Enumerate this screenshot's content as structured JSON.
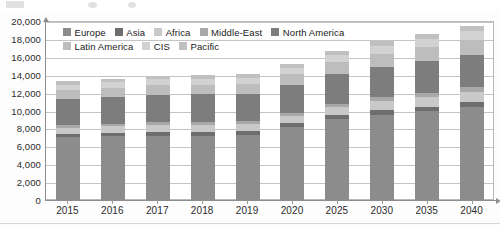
{
  "chart_data": {
    "type": "bar",
    "subtype": "stacked-bar",
    "title": "",
    "xlabel": "",
    "ylabel": "",
    "ylim": [
      0,
      20000
    ],
    "ytick_step": 2000,
    "ytick_labels": [
      "0",
      "2,000",
      "4,000",
      "6,000",
      "8,000",
      "10,000",
      "12,000",
      "14,000",
      "16,000",
      "18,000",
      "20,000"
    ],
    "grid": true,
    "legend_position": "top-inside",
    "categories": [
      "2015",
      "2016",
      "2017",
      "2018",
      "2019",
      "2020",
      "2025",
      "2030",
      "2035",
      "2040"
    ],
    "series": [
      {
        "name": "Europe",
        "color": "#8c8c8c",
        "values": [
          7000,
          7100,
          7200,
          7200,
          7250,
          8150,
          9000,
          9550,
          9900,
          10400
        ]
      },
      {
        "name": "Asia",
        "color": "#6e6e6e",
        "values": [
          400,
          410,
          420,
          430,
          440,
          450,
          480,
          510,
          540,
          570
        ]
      },
      {
        "name": "Africa",
        "color": "#c9c9c9",
        "values": [
          700,
          720,
          760,
          780,
          800,
          830,
          920,
          1000,
          1080,
          1150
        ]
      },
      {
        "name": "Middle-East",
        "color": "#a8a8a8",
        "values": [
          300,
          310,
          320,
          330,
          340,
          350,
          380,
          410,
          440,
          470
        ]
      },
      {
        "name": "North America",
        "color": "#7d7d7d",
        "values": [
          2900,
          2960,
          3080,
          3060,
          3060,
          3120,
          3320,
          3450,
          3540,
          3610
        ]
      },
      {
        "name": "Latin America",
        "color": "#bdbdbd",
        "values": [
          1000,
          1030,
          1060,
          1080,
          1100,
          1150,
          1300,
          1450,
          1600,
          1700
        ]
      },
      {
        "name": "CIS",
        "color": "#d2d2d2",
        "values": [
          600,
          620,
          640,
          660,
          680,
          700,
          780,
          860,
          930,
          1000
        ]
      },
      {
        "name": "Pacific",
        "color": "#c0c0c0",
        "values": [
          400,
          410,
          420,
          430,
          440,
          450,
          480,
          510,
          530,
          560
        ]
      }
    ],
    "totals": [
      13300,
      13560,
      13900,
      13970,
      14110,
      15200,
      16660,
      17740,
      18560,
      19460
    ],
    "legend_rows": [
      [
        "Europe",
        "Asia",
        "Africa",
        "Middle-East",
        "North America"
      ],
      [
        "Latin America",
        "CIS",
        "Pacific"
      ]
    ]
  },
  "axis": {
    "y_labels": [
      "20,000",
      "18,000",
      "16,000",
      "14,000",
      "12,000",
      "10,000",
      "8,000",
      "6,000",
      "4,000",
      "2,000",
      "0"
    ],
    "x_labels": [
      "2015",
      "2016",
      "2017",
      "2018",
      "2019",
      "2020",
      "2025",
      "2030",
      "2035",
      "2040"
    ]
  }
}
